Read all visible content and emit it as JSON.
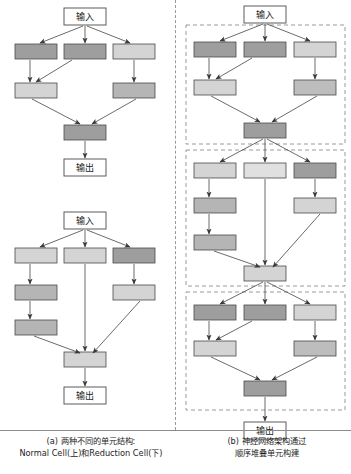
{
  "figure": {
    "title_text_input": "输入",
    "title_text_output": "输出",
    "colors": {
      "dark_gray": "#9e9e9e",
      "medium_gray": "#b5b5b5",
      "light_gray": "#d4d4d4",
      "box_stroke": "#4a4a4a",
      "arrow": "#3a3a3a",
      "dashed_border": "#8f8f8f",
      "background": "#ffffff"
    },
    "panels": [
      {
        "id": "panel-a",
        "caption_lines": [
          "(a) 两种不同的单元结构:",
          "Normal Cell(上)和Reduction Cell(下)"
        ],
        "cells": [
          {
            "id": "normal-cell",
            "name": "Normal Cell",
            "input_label": "输入",
            "output_label": "输出",
            "ops": [
              {
                "id": "n1",
                "shade": "dark_gray"
              },
              {
                "id": "n2",
                "shade": "dark_gray"
              },
              {
                "id": "n3",
                "shade": "light_gray"
              },
              {
                "id": "n4",
                "shade": "light_gray"
              },
              {
                "id": "n5",
                "shade": "medium_gray"
              },
              {
                "id": "n6",
                "shade": "dark_gray"
              }
            ]
          },
          {
            "id": "reduction-cell",
            "name": "Reduction Cell",
            "input_label": "输入",
            "output_label": "输出",
            "ops": [
              {
                "id": "r1",
                "shade": "light_gray"
              },
              {
                "id": "r2",
                "shade": "light_gray"
              },
              {
                "id": "r3",
                "shade": "dark_gray"
              },
              {
                "id": "r4",
                "shade": "medium_gray"
              },
              {
                "id": "r5",
                "shade": "light_gray"
              },
              {
                "id": "r6",
                "shade": "medium_gray"
              },
              {
                "id": "r7",
                "shade": "light_gray"
              }
            ]
          }
        ]
      },
      {
        "id": "panel-b",
        "caption_lines": [
          "(b) 神经网络架构通过",
          "顺序堆叠单元构建"
        ],
        "input_label": "输入",
        "output_label": "输出",
        "stacked_cells": [
          {
            "id": "stack-cell-1",
            "type": "Normal Cell"
          },
          {
            "id": "stack-cell-2",
            "type": "Reduction Cell"
          },
          {
            "id": "stack-cell-3",
            "type": "Normal Cell"
          }
        ]
      }
    ]
  }
}
